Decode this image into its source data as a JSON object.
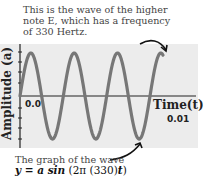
{
  "annotation_top": "This is the wave of the higher note E, which has a frequency of 330 Hertz.",
  "annotation_bottom": "The graph of the wave",
  "formula": "y = a sin (2π (330)t)",
  "colors": {
    "wave": "#777777",
    "plot_background": "#ececec",
    "axis": "#222222",
    "arrow": "#111111"
  },
  "chart_data": {
    "type": "line",
    "title": "",
    "xlabel": "Time(t)",
    "ylabel": "Amplitude (a)",
    "x_ticks": [
      "0.0",
      "0.01"
    ],
    "xlim": [
      0,
      0.01
    ],
    "ylim": [
      -1,
      1
    ],
    "grid": false,
    "legend": null,
    "series": [
      {
        "name": "E note 330 Hz",
        "function": "a*sin(2*pi*330*t)",
        "frequency_hz": 330,
        "cycles_shown": 3.3
      }
    ],
    "annotations": [
      "This is the wave of the higher note E, which has a frequency of 330 Hertz.",
      "The graph of the wave y = a sin (2π (330)t)"
    ]
  }
}
